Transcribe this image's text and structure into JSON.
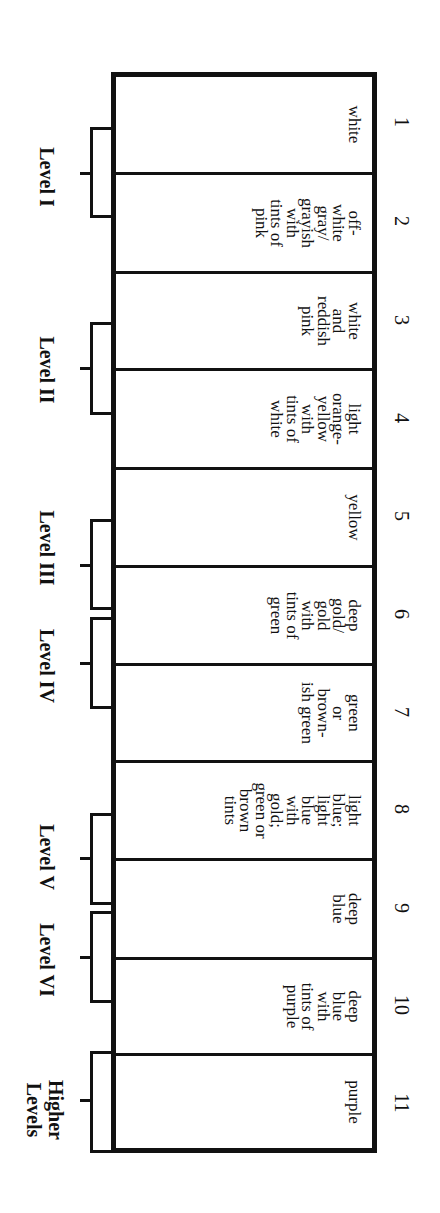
{
  "diagram": {
    "orientation": "rotated 90 degrees clockwise",
    "columns": [
      {
        "number": "1",
        "color_text": "white"
      },
      {
        "number": "2",
        "color_text": "off-\nwhite\ngray/\ngrayish\nwith\ntints of\npink"
      },
      {
        "number": "3",
        "color_text": "white\nand\nreddish\npink"
      },
      {
        "number": "4",
        "color_text": "light\norange-\nyellow\nwith\ntints of\nwhite"
      },
      {
        "number": "5",
        "color_text": "yellow"
      },
      {
        "number": "6",
        "color_text": "deep\ngold/\ngold\nwith\ntints of\ngreen"
      },
      {
        "number": "7",
        "color_text": "green\nor\nbrown-\nish green"
      },
      {
        "number": "8",
        "color_text": "light\nblue;\nlight\nblue\nwith\ngold;\ngreen or\nbrown\ntints"
      },
      {
        "number": "9",
        "color_text": "deep\nblue"
      },
      {
        "number": "10",
        "color_text": "deep\nblue\nwith\ntints of\npurple"
      },
      {
        "number": "11",
        "color_text": "purple"
      }
    ],
    "levels": [
      {
        "label": "Level I",
        "spans": [
          "1",
          "2"
        ]
      },
      {
        "label": "Level II",
        "spans": [
          "3",
          "4"
        ]
      },
      {
        "label": "Level III",
        "spans": [
          "5",
          "6"
        ]
      },
      {
        "label": "Level IV",
        "spans": [
          "6",
          "7"
        ]
      },
      {
        "label": "Level V",
        "spans": [
          "8",
          "9"
        ]
      },
      {
        "label": "Level VI",
        "spans": [
          "9",
          "10"
        ]
      },
      {
        "label": "Higher\nLevels",
        "spans": [
          "11"
        ]
      }
    ],
    "colors": {
      "line": "#111111",
      "background": "#ffffff"
    }
  }
}
